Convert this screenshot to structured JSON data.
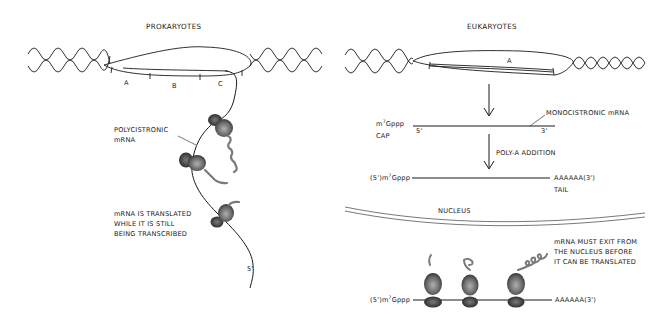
{
  "prokaryotes": {
    "title": "PROKARYOTES",
    "genes": [
      "A",
      "B",
      "C"
    ],
    "mrna_label_line1": "POLYCISTRONIC",
    "mrna_label_line2": "mRNA",
    "note_line1": "mRNA IS TRANSLATED",
    "note_line2": "WHILE IT IS STILL",
    "note_line3": "BEING TRANSCRIBED",
    "five_prime": "5'"
  },
  "eukaryotes": {
    "title": "EUKARYOTES",
    "gene": "A",
    "cap_prefix": "m",
    "cap_sup": "7",
    "cap_suffix": "Gppp",
    "cap_label": "CAP",
    "five_prime": "5'",
    "three_prime": "3'",
    "mono_label": "MONOCISTRONIC mRNA",
    "polya_label": "POLY-A ADDITION",
    "capped_prefix": "(5')m",
    "capped_sup": "7",
    "capped_suffix": "Gppp",
    "tail_seq": "AAAAAA(3')",
    "tail_label": "TAIL",
    "nucleus_label": "NUCLEUS",
    "exit_note_line1": "mRNA MUST EXIT FROM",
    "exit_note_line2": "THE NUCLEUS BEFORE",
    "exit_note_line3": "IT CAN BE TRANSLATED",
    "translated_prefix": "(5')m",
    "translated_sup": "7",
    "translated_suffix": "Gppp",
    "translated_tail": "AAAAAA(3')"
  },
  "colors": {
    "line": "#1a1a1a",
    "ribosome_dark": "#3a3a3a",
    "ribosome_light": "#9a9a9a",
    "peptide": "#7a7a7a",
    "background": "#ffffff"
  }
}
